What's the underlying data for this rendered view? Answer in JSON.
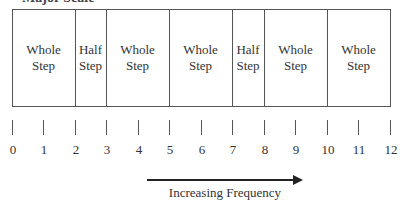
{
  "title": "Major Scale",
  "steps": [
    {
      "label_line1": "Whole",
      "label_line2": "Step",
      "from": 0,
      "to": 2
    },
    {
      "label_line1": "Half",
      "label_line2": "Step",
      "from": 2,
      "to": 3
    },
    {
      "label_line1": "Whole",
      "label_line2": "Step",
      "from": 3,
      "to": 5
    },
    {
      "label_line1": "Whole",
      "label_line2": "Step",
      "from": 5,
      "to": 7
    },
    {
      "label_line1": "Half",
      "label_line2": "Step",
      "from": 7,
      "to": 8
    },
    {
      "label_line1": "Whole",
      "label_line2": "Step",
      "from": 8,
      "to": 10
    },
    {
      "label_line1": "Whole",
      "label_line2": "Step",
      "from": 10,
      "to": 12
    }
  ],
  "ticks": [
    "0",
    "1",
    "2",
    "3",
    "4",
    "5",
    "6",
    "7",
    "8",
    "9",
    "10",
    "11",
    "12"
  ],
  "arrow": {
    "label": "Increasing Frequency",
    "direction": "right"
  }
}
